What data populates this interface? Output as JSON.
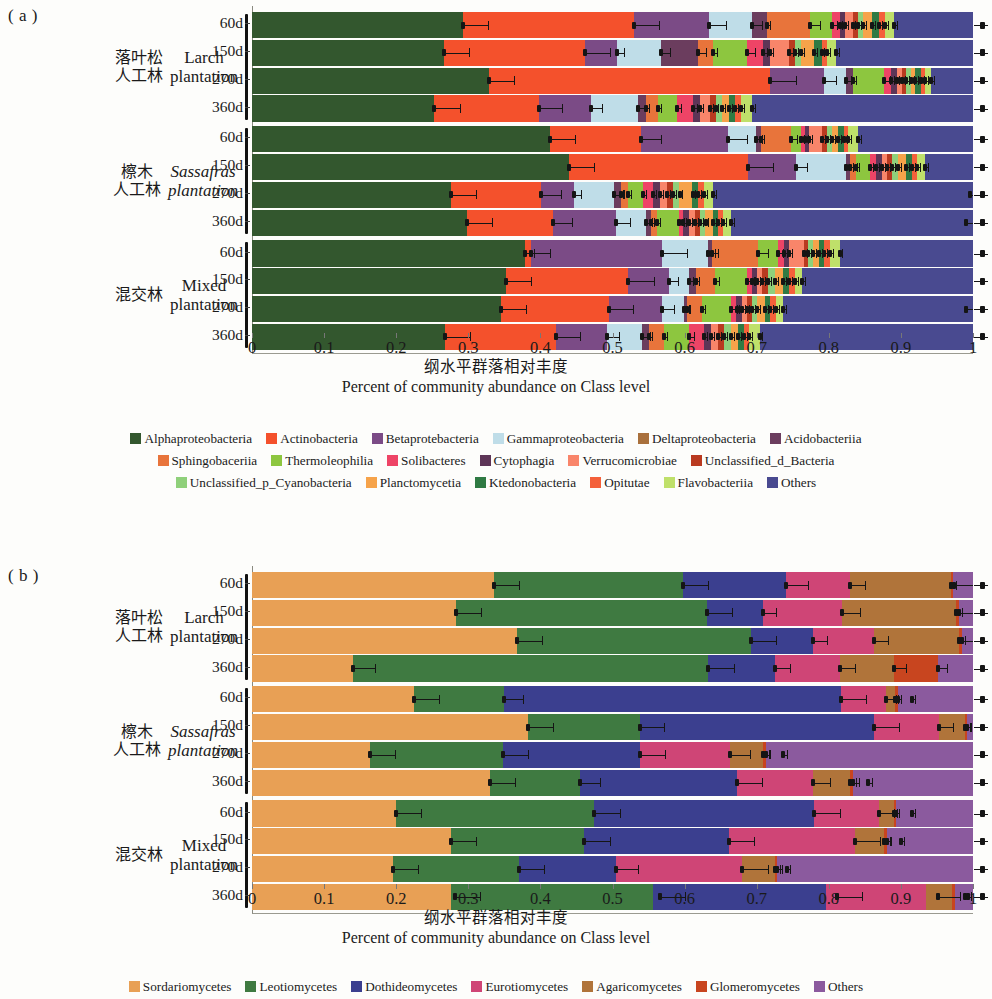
{
  "panels": [
    {
      "tag": "( a )",
      "axis_title_cn": "纲水平群落相对丰度",
      "axis_title_en": "Percent of community abundance on Class level",
      "xticks": [
        "0",
        "0.1",
        "0.2",
        "0.3",
        "0.4",
        "0.5",
        "0.6",
        "0.7",
        "0.8",
        "0.9",
        "1"
      ],
      "groups": [
        {
          "cn": "落叶松\n人工林",
          "en": "Larch\nplantation",
          "italic": false
        },
        {
          "cn": "檫木\n人工林",
          "en": "Sassafras\nplantation",
          "italic": true
        },
        {
          "cn": "混交林",
          "en": "Mixed\nplantation",
          "italic": false
        }
      ],
      "rowticks": [
        "60d",
        "150d",
        "270d",
        "360d",
        "60d",
        "150d",
        "270d",
        "360d",
        "60d",
        "150d",
        "270d",
        "360d"
      ],
      "legend": [
        [
          {
            "label": "Alphaproteobacteria",
            "color": "#33572e"
          },
          {
            "label": "Actinobacteria",
            "color": "#f4512c"
          },
          {
            "label": "Betaprotebacteria",
            "color": "#7b4b86"
          },
          {
            "label": "Gammaproteobacteria",
            "color": "#bfdde8"
          },
          {
            "label": "Deltaproteobacteria",
            "color": "#a9703c"
          },
          {
            "label": "Acidobacteriia",
            "color": "#6b3d5e"
          }
        ],
        [
          {
            "label": "Sphingobaceriia",
            "color": "#e8743b"
          },
          {
            "label": "Thermoleophilia",
            "color": "#8dc63f"
          },
          {
            "label": "Solibacteres",
            "color": "#ee4466"
          },
          {
            "label": "Cytophagia",
            "color": "#5d3557"
          },
          {
            "label": "Verrucomicrobiae",
            "color": "#f9856a"
          },
          {
            "label": "Unclassified_d_Bacteria",
            "color": "#b93a20"
          }
        ],
        [
          {
            "label": "Unclassified_p_Cyanobacteria",
            "color": "#8fd07a"
          },
          {
            "label": "Planctomycetia",
            "color": "#f6a34a"
          },
          {
            "label": "Ktedonobacteria",
            "color": "#2f7a43"
          },
          {
            "label": "Opitutae",
            "color": "#f4603a"
          },
          {
            "label": "Flavobacteriia",
            "color": "#bfe06a"
          },
          {
            "label": "Others",
            "color": "#494a90"
          }
        ]
      ]
    },
    {
      "tag": "( b )",
      "axis_title_cn": "纲水平群落相对丰度",
      "axis_title_en": "Percent of community abundance on Class level",
      "xticks": [
        "0",
        "0.1",
        "0.2",
        "0.3",
        "0.4",
        "0.5",
        "0.6",
        "0.7",
        "0.8",
        "0.9",
        "1"
      ],
      "groups": [
        {
          "cn": "落叶松\n人工林",
          "en": "Larch\nplantation",
          "italic": false
        },
        {
          "cn": "檫木\n人工林",
          "en": "Sassafras\nplantation",
          "italic": true
        },
        {
          "cn": "混交林",
          "en": "Mixed\nplantation",
          "italic": false
        }
      ],
      "rowticks": [
        "60d",
        "150d",
        "270d",
        "360d",
        "60d",
        "150d",
        "270d",
        "360d",
        "60d",
        "150d",
        "270d",
        "360d"
      ],
      "legend": [
        [
          {
            "label": "Sordariomycetes",
            "color": "#e8a055"
          },
          {
            "label": "Leotiomycetes",
            "color": "#3f7a41"
          },
          {
            "label": "Dothideomycetes",
            "color": "#3b3f8f"
          },
          {
            "label": "Eurotiomycetes",
            "color": "#cf4576"
          },
          {
            "label": "Agaricomycetes",
            "color": "#b0743a"
          },
          {
            "label": "Glomeromycetes",
            "color": "#c8451f"
          },
          {
            "label": "Others",
            "color": "#8b5a9e"
          }
        ]
      ]
    }
  ],
  "chart_data": [
    {
      "type": "bar",
      "orientation": "horizontal",
      "stacked": true,
      "normalized": true,
      "panel": "( a )",
      "title": "Percent of community abundance on Class level",
      "title_cn": "纲水平群落相对丰度",
      "xlabel": "Percent of community abundance on Class level",
      "ylabel": "",
      "xlim": [
        0,
        1
      ],
      "xticks": [
        0,
        0.1,
        0.2,
        0.3,
        0.4,
        0.5,
        0.6,
        0.7,
        0.8,
        0.9,
        1
      ],
      "grid": false,
      "legend_position": "bottom",
      "categories": [
        "Larch plantation 60d",
        "Larch plantation 150d",
        "Larch plantation 270d",
        "Larch plantation 360d",
        "Sassafras plantation 60d",
        "Sassafras plantation 150d",
        "Sassafras plantation 270d",
        "Sassafras plantation 360d",
        "Mixed plantation 60d",
        "Mixed plantation 150d",
        "Mixed plantation 270d",
        "Mixed plantation 360d"
      ],
      "series": [
        {
          "name": "Alphaproteobacteria",
          "color": "#33572e",
          "values": [
            0.293,
            0.266,
            0.329,
            0.253,
            0.413,
            0.44,
            0.276,
            0.298,
            0.379,
            0.352,
            0.345,
            0.268
          ]
        },
        {
          "name": "Actinobacteria",
          "color": "#f4512c",
          "values": [
            0.237,
            0.196,
            0.39,
            0.145,
            0.126,
            0.248,
            0.125,
            0.119,
            0.008,
            0.17,
            0.15,
            0.153
          ]
        },
        {
          "name": "Betaprotebacteria",
          "color": "#7b4b86",
          "values": [
            0.104,
            0.044,
            0.075,
            0.072,
            0.121,
            0.067,
            0.045,
            0.088,
            0.182,
            0.056,
            0.074,
            0.072
          ]
        },
        {
          "name": "Gammaproteobacteria",
          "color": "#bfdde8",
          "values": [
            0.06,
            0.061,
            0.03,
            0.066,
            0.039,
            0.069,
            0.056,
            0.041,
            0.063,
            0.028,
            0.03,
            0.048
          ]
        },
        {
          "name": "Deltaproteobacteria",
          "color": "#a9703c",
          "values": [
            0.0,
            0.0,
            0.0,
            0.0,
            0.0,
            0.0,
            0.0,
            0.0,
            0.0,
            0.0,
            0.0,
            0.0
          ]
        },
        {
          "name": "Acidobacteriia",
          "color": "#6b3d5e",
          "values": [
            0.02,
            0.051,
            0.01,
            0.01,
            0.007,
            0.006,
            0.01,
            0.008,
            0.006,
            0.01,
            0.005,
            0.01
          ]
        },
        {
          "name": "Sphingobaceriia",
          "color": "#e8743b",
          "values": [
            0.06,
            0.022,
            0.0,
            0.017,
            0.041,
            0.008,
            0.01,
            0.008,
            0.064,
            0.026,
            0.02,
            0.02
          ]
        },
        {
          "name": "Thermoleophilia",
          "color": "#8dc63f",
          "values": [
            0.031,
            0.047,
            0.042,
            0.026,
            0.015,
            0.019,
            0.02,
            0.03,
            0.028,
            0.045,
            0.04,
            0.035
          ]
        },
        {
          "name": "Solibacteres",
          "color": "#ee4466",
          "values": [
            0.01,
            0.022,
            0.01,
            0.023,
            0.005,
            0.008,
            0.014,
            0.006,
            0.008,
            0.006,
            0.008,
            0.021
          ]
        },
        {
          "name": "Cytophagia",
          "color": "#5d3557",
          "values": [
            0.008,
            0.01,
            0.008,
            0.01,
            0.006,
            0.009,
            0.01,
            0.008,
            0.007,
            0.008,
            0.008,
            0.01
          ]
        },
        {
          "name": "Verrucomicrobiae",
          "color": "#f9856a",
          "values": [
            0.01,
            0.026,
            0.007,
            0.013,
            0.018,
            0.007,
            0.01,
            0.008,
            0.02,
            0.007,
            0.006,
            0.01
          ]
        },
        {
          "name": "Unclassified_d_Bacteria",
          "color": "#b93a20",
          "values": [
            0.007,
            0.008,
            0.006,
            0.008,
            0.006,
            0.007,
            0.008,
            0.007,
            0.006,
            0.008,
            0.007,
            0.008
          ]
        },
        {
          "name": "Unclassified_p_Cyanobacteria",
          "color": "#8fd07a",
          "values": [
            0.008,
            0.009,
            0.007,
            0.009,
            0.007,
            0.008,
            0.009,
            0.008,
            0.007,
            0.009,
            0.008,
            0.009
          ]
        },
        {
          "name": "Planctomycetia",
          "color": "#f6a34a",
          "values": [
            0.012,
            0.018,
            0.006,
            0.01,
            0.009,
            0.011,
            0.018,
            0.01,
            0.008,
            0.012,
            0.01,
            0.01
          ]
        },
        {
          "name": "Ktedonobacteria",
          "color": "#2f7a43",
          "values": [
            0.01,
            0.01,
            0.008,
            0.008,
            0.008,
            0.008,
            0.008,
            0.008,
            0.008,
            0.008,
            0.008,
            0.008
          ]
        },
        {
          "name": "Opitutae",
          "color": "#f4603a",
          "values": [
            0.008,
            0.008,
            0.006,
            0.008,
            0.006,
            0.008,
            0.008,
            0.006,
            0.008,
            0.008,
            0.008,
            0.008
          ]
        },
        {
          "name": "Flavobacteriia",
          "color": "#bfe06a",
          "values": [
            0.012,
            0.012,
            0.008,
            0.016,
            0.013,
            0.01,
            0.013,
            0.011,
            0.013,
            0.01,
            0.01,
            0.014
          ]
        },
        {
          "name": "Others",
          "color": "#494a90",
          "values": [
            0.11,
            0.19,
            0.058,
            0.306,
            0.16,
            0.067,
            0.356,
            0.326,
            0.185,
            0.237,
            0.253,
            0.296
          ]
        }
      ],
      "error_bars_present": true
    },
    {
      "type": "bar",
      "orientation": "horizontal",
      "stacked": true,
      "normalized": true,
      "panel": "( b )",
      "title": "Percent of community abundance on Class level",
      "title_cn": "纲水平群落相对丰度",
      "xlabel": "Percent of community abundance on Class level",
      "ylabel": "",
      "xlim": [
        0,
        1
      ],
      "xticks": [
        0,
        0.1,
        0.2,
        0.3,
        0.4,
        0.5,
        0.6,
        0.7,
        0.8,
        0.9,
        1
      ],
      "grid": false,
      "legend_position": "bottom",
      "categories": [
        "Larch plantation 60d",
        "Larch plantation 150d",
        "Larch plantation 270d",
        "Larch plantation 360d",
        "Sassafras plantation 60d",
        "Sassafras plantation 150d",
        "Sassafras plantation 270d",
        "Sassafras plantation 360d",
        "Mixed plantation 60d",
        "Mixed plantation 150d",
        "Mixed plantation 270d",
        "Mixed plantation 360d"
      ],
      "series": [
        {
          "name": "Sordariomycetes",
          "color": "#e8a055",
          "values": [
            0.335,
            0.283,
            0.367,
            0.14,
            0.225,
            0.383,
            0.163,
            0.33,
            0.2,
            0.276,
            0.195,
            0.281,
            0.167
          ]
        },
        {
          "name": "Leotiomycetes",
          "color": "#3f7a41",
          "values": [
            0.263,
            0.348,
            0.325,
            0.493,
            0.124,
            0.155,
            0.185,
            0.125,
            0.275,
            0.185,
            0.175,
            0.285
          ]
        },
        {
          "name": "Dothideomycetes",
          "color": "#3b3f8f",
          "values": [
            0.142,
            0.078,
            0.086,
            0.093,
            0.468,
            0.325,
            0.19,
            0.218,
            0.305,
            0.2,
            0.135,
            0.245
          ]
        },
        {
          "name": "Eurotiomycetes",
          "color": "#cf4576",
          "values": [
            0.09,
            0.11,
            0.085,
            0.09,
            0.062,
            0.09,
            0.125,
            0.105,
            0.09,
            0.175,
            0.175,
            0.14
          ]
        },
        {
          "name": "Agaricomycetes",
          "color": "#b0743a",
          "values": [
            0.14,
            0.158,
            0.118,
            0.075,
            0.013,
            0.036,
            0.046,
            0.052,
            0.02,
            0.041,
            0.045,
            0.038
          ]
        },
        {
          "name": "Glomeromycetes",
          "color": "#c8451f",
          "values": [
            0.003,
            0.004,
            0.004,
            0.06,
            0.004,
            0.003,
            0.004,
            0.004,
            0.003,
            0.004,
            0.003,
            0.004
          ]
        },
        {
          "name": "Others",
          "color": "#8b5a9e",
          "values": [
            0.027,
            0.019,
            0.015,
            0.049,
            0.019,
            0.008,
            0.024,
            0.021,
            0.022,
            0.019,
            0.014,
            0.025
          ]
        }
      ],
      "error_bars_present": true
    }
  ]
}
